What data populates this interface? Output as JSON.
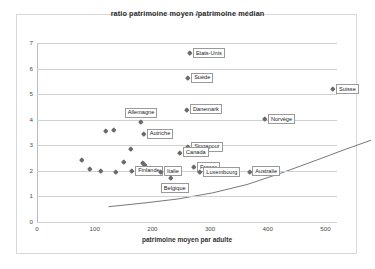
{
  "chart_data": {
    "type": "scatter",
    "title": "ratio patrimoine moyen /patrimoine médian",
    "xlabel": "patrimoine moyen par adulte",
    "ylabel": "",
    "xlim": [
      0,
      520
    ],
    "ylim": [
      0,
      7
    ],
    "xticks": [
      "0",
      "100",
      "200",
      "300",
      "400",
      "500"
    ],
    "xtick_values": [
      0,
      100,
      200,
      300,
      400,
      500
    ],
    "yticks": [
      "0",
      "1",
      "2",
      "3",
      "4",
      "5",
      "6",
      "7"
    ],
    "ytick_values": [
      0,
      1,
      2,
      3,
      4,
      5,
      6,
      7
    ],
    "grid": true,
    "legend": "none",
    "has_trendline": true,
    "trendline_note": "courbe de tendance croissante",
    "points": [
      {
        "label": "Etats-Unis",
        "x": 265,
        "y": 6.6,
        "label_side": "right"
      },
      {
        "label": "Suède",
        "x": 262,
        "y": 5.65,
        "label_side": "right"
      },
      {
        "label": "Suisse",
        "x": 513,
        "y": 5.2,
        "label_side": "right"
      },
      {
        "label": "Danemark",
        "x": 260,
        "y": 4.4,
        "label_side": "right"
      },
      {
        "label": "Allemagne",
        "x": 180,
        "y": 3.92,
        "label_side": "above"
      },
      {
        "label": "Norvège",
        "x": 395,
        "y": 4.02,
        "label_side": "right"
      },
      {
        "label": "Autriche",
        "x": 185,
        "y": 3.45,
        "label_side": "right"
      },
      {
        "label": "Singapour",
        "x": 262,
        "y": 2.95,
        "label_side": "right"
      },
      {
        "label": "Canada",
        "x": 248,
        "y": 2.72,
        "label_side": "right"
      },
      {
        "label": "Finlande",
        "x": 165,
        "y": 2.0,
        "label_side": "right"
      },
      {
        "label": "Italie",
        "x": 215,
        "y": 1.98,
        "label_side": "right"
      },
      {
        "label": "Belgique",
        "x": 232,
        "y": 1.72,
        "label_side": "below"
      },
      {
        "label": "France",
        "x": 272,
        "y": 2.15,
        "label_side": "right"
      },
      {
        "label": "Luxembourg",
        "x": 283,
        "y": 1.95,
        "label_side": "right"
      },
      {
        "label": "Australie",
        "x": 368,
        "y": 1.98,
        "label_side": "right"
      }
    ],
    "unlabeled_points": [
      {
        "x": 78,
        "y": 2.45
      },
      {
        "x": 92,
        "y": 2.1
      },
      {
        "x": 110,
        "y": 2.02
      },
      {
        "x": 120,
        "y": 3.55
      },
      {
        "x": 133,
        "y": 3.6
      },
      {
        "x": 136,
        "y": 1.97
      },
      {
        "x": 150,
        "y": 2.35
      },
      {
        "x": 163,
        "y": 2.88
      },
      {
        "x": 183,
        "y": 2.3
      },
      {
        "x": 186,
        "y": 2.22
      }
    ],
    "trend_path": [
      {
        "x": 60,
        "y": 2.28
      },
      {
        "x": 120,
        "y": 2.42
      },
      {
        "x": 180,
        "y": 2.58
      },
      {
        "x": 240,
        "y": 2.82
      },
      {
        "x": 300,
        "y": 3.15
      },
      {
        "x": 360,
        "y": 3.6
      },
      {
        "x": 420,
        "y": 4.1
      },
      {
        "x": 470,
        "y": 4.52
      },
      {
        "x": 515,
        "y": 4.88
      }
    ]
  }
}
